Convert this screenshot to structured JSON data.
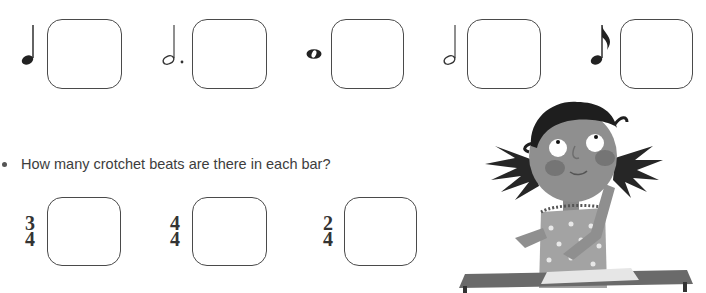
{
  "note_values_section": {
    "items": [
      {
        "symbol": "crotchet",
        "label": "crotchet-note",
        "answer": ""
      },
      {
        "symbol": "dotted-minim",
        "label": "dotted-minim-note",
        "answer": ""
      },
      {
        "symbol": "semibreve",
        "label": "semibreve-note",
        "answer": ""
      },
      {
        "symbol": "minim",
        "label": "minim-note",
        "answer": ""
      },
      {
        "symbol": "quaver",
        "label": "quaver-note",
        "answer": ""
      }
    ]
  },
  "time_signature_section": {
    "question": "How many crotchet beats are there in each bar?",
    "items": [
      {
        "top": "3",
        "bottom": "4",
        "answer": ""
      },
      {
        "top": "4",
        "bottom": "4",
        "answer": ""
      },
      {
        "top": "2",
        "bottom": "4",
        "answer": ""
      }
    ]
  },
  "illustration": {
    "subject": "girl-thinking-at-desk"
  }
}
